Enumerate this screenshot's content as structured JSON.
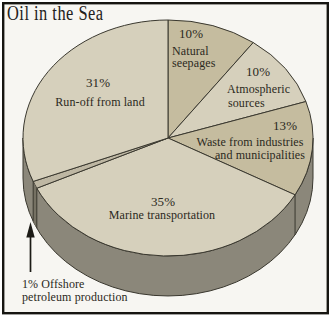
{
  "chart_data": {
    "type": "pie",
    "title": "Oil in the Sea",
    "start_angle_deg": 90,
    "direction": "clockwise",
    "style_3d": true,
    "legend_position": "none",
    "slices": [
      {
        "label": "Natural seepages",
        "pct": 10,
        "pct_label": "10%",
        "lines": [
          "Natural",
          "seepages"
        ],
        "shade": "dark"
      },
      {
        "label": "Atmospheric sources",
        "pct": 10,
        "pct_label": "10%",
        "lines": [
          "Atmospheric",
          "sources"
        ],
        "shade": "light"
      },
      {
        "label": "Waste from industries and municipalities",
        "pct": 13,
        "pct_label": "13%",
        "lines": [
          "Waste from industries",
          "and municipalities"
        ],
        "shade": "dark"
      },
      {
        "label": "Marine transportation",
        "pct": 35,
        "pct_label": "35%",
        "lines": [
          "Marine transportation"
        ],
        "shade": "light"
      },
      {
        "label": "Offshore petroleum production",
        "pct": 1,
        "pct_label": "1%",
        "lines": [
          "1% Offshore",
          "petroleum production"
        ],
        "shade": "mid",
        "callout": true
      },
      {
        "label": "Run-off from land",
        "pct": 31,
        "pct_label": "31%",
        "lines": [
          "Run-off from land"
        ],
        "shade": "light"
      }
    ],
    "colors": {
      "light": "#d6d0bc",
      "dark": "#c5bc9f",
      "mid": "#beb7a3",
      "side": "#8b877a",
      "side_dark": "#757163",
      "outline": "#3a382f",
      "text": "#2b2921",
      "frame": "#161511",
      "background": "#f7f6f2",
      "arrow": "#1c1b16"
    }
  }
}
